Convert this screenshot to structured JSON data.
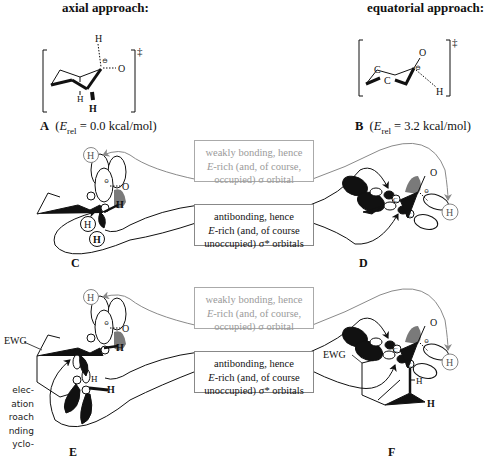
{
  "headings": {
    "axial": "axial approach:",
    "equatorial": "equatorial approach:"
  },
  "structures": {
    "A": {
      "letter": "A",
      "caption_open": "(",
      "E": "E",
      "sub": "rel",
      "caption_value": " = 0.0 kcal/mol)"
    },
    "B": {
      "letter": "B",
      "caption_open": "(",
      "E": "E",
      "sub": "rel",
      "caption_value": " = 3.2 kcal/mol)"
    },
    "C": {
      "letter": "C"
    },
    "D": {
      "letter": "D"
    },
    "E": {
      "letter": "E"
    },
    "F": {
      "letter": "F"
    }
  },
  "ts_mark": "‡",
  "atoms": {
    "H": "H",
    "O": "O",
    "C": "C",
    "minus": "⊖",
    "EWG": "EWG"
  },
  "boxes": {
    "weak_top": {
      "line1": "weakly bonding, hence",
      "line2_italic": "E",
      "line2_rest": "-rich (and, of course,",
      "line3": "occupied) σ orbital"
    },
    "anti_top": {
      "line1": "antibonding, hence",
      "line2_italic": "E",
      "line2_rest": "-rich (and, of course",
      "line3": "unoccupied) σ* orbitals"
    },
    "weak_bottom": {
      "line1": "weakly bonding, hence",
      "line2_italic": "E",
      "line2_rest": "-rich (and, of course,",
      "line3": "occupied) σ orbital"
    },
    "anti_bottom": {
      "line1": "antibonding, hence",
      "line2_italic": "E",
      "line2_rest": "-rich (and, of course",
      "line3": "unoccupied) σ* orbitals"
    }
  },
  "side_text": [
    "elec-",
    "ation",
    "roach",
    "nding",
    "yclo-",
    "..."
  ],
  "colors": {
    "ink": "#111111",
    "grey_orbital": "#7a7a7a",
    "grey_text": "#9a9a9a",
    "box_border": "#999999"
  }
}
